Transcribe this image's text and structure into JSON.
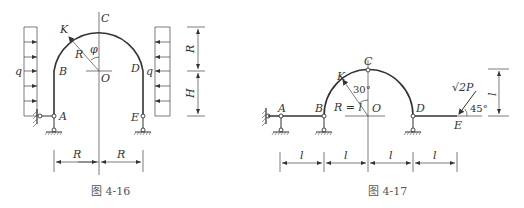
{
  "figures": [
    {
      "id": "fig-4-16",
      "caption": "图 4-16",
      "points": {
        "A": "A",
        "B": "B",
        "C": "C",
        "D": "D",
        "E": "E",
        "K": "K",
        "O": "O"
      },
      "labels": {
        "radius": "R",
        "angle": "φ",
        "load_left": "q",
        "load_right": "q",
        "dim_bottom_left": "R",
        "dim_bottom_right": "R",
        "dim_right_top": "R",
        "dim_right_bottom": "H"
      }
    },
    {
      "id": "fig-4-17",
      "caption": "图 4-17",
      "points": {
        "A": "A",
        "B": "B",
        "C": "C",
        "D": "D",
        "E": "E",
        "K": "K",
        "O": "O"
      },
      "labels": {
        "radius": "R = l",
        "angle": "30°",
        "force": "√2P",
        "force_angle": "45°",
        "dim_bottom": [
          "l",
          "l",
          "l",
          "l"
        ],
        "dim_right": "l"
      }
    }
  ]
}
